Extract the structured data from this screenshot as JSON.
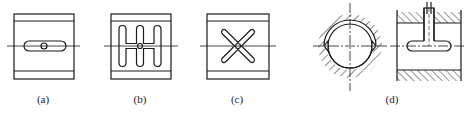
{
  "figure": {
    "panels": [
      {
        "id": "a",
        "label": "(a)",
        "description": "square block with straight horizontal oil groove and central hole"
      },
      {
        "id": "b",
        "label": "(b)",
        "description": "square block with H-shaped (triple vertical) oil groove and central hole"
      },
      {
        "id": "c",
        "label": "(c)",
        "description": "square block with X-shaped (crossed) oil groove and central hole"
      },
      {
        "id": "d",
        "label": "(d)",
        "description": "bearing cross-section with crescent oil groove and side view with feed hole and axial groove, hatched housing"
      }
    ],
    "colors": {
      "line": "#1a1a1a",
      "background": "#ffffff"
    }
  }
}
